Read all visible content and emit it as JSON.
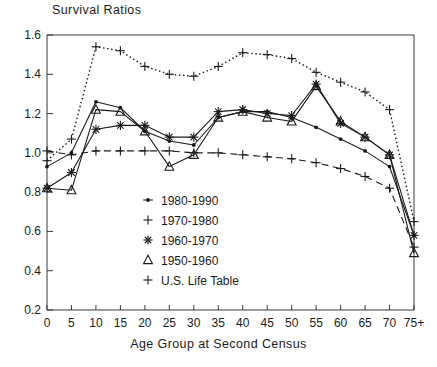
{
  "chart_data": {
    "type": "line",
    "title": "Survival Ratios",
    "xlabel": "Age Group at Second Census",
    "ylabel": "",
    "categories": [
      "0",
      "5",
      "10",
      "15",
      "20",
      "25",
      "30",
      "35",
      "40",
      "45",
      "50",
      "55",
      "60",
      "65",
      "70",
      "75+"
    ],
    "ylim": [
      0.2,
      1.6
    ],
    "yticks": [
      0.2,
      0.4,
      0.6,
      0.8,
      1.0,
      1.2,
      1.4,
      1.6
    ],
    "ytick_labels": [
      "0.2",
      "0.4",
      "0.6",
      "0.8",
      "1.0",
      "1.2",
      "1.4",
      "1.6"
    ],
    "grid": false,
    "legend_position": "inside-center-left",
    "series": [
      {
        "name": "1980-1990",
        "marker": "small-dot",
        "line_style": "solid",
        "values": [
          0.93,
          1.0,
          1.26,
          1.23,
          1.11,
          1.06,
          1.04,
          1.18,
          1.21,
          1.21,
          1.18,
          1.13,
          1.07,
          1.01,
          0.93,
          0.58
        ]
      },
      {
        "name": "1970-1980",
        "marker": "plus",
        "line_style": "dotted",
        "values": [
          0.96,
          1.07,
          1.54,
          1.52,
          1.44,
          1.4,
          1.39,
          1.44,
          1.51,
          1.5,
          1.48,
          1.41,
          1.36,
          1.31,
          1.22,
          0.65
        ]
      },
      {
        "name": "1960-1970",
        "marker": "asterisk",
        "line_style": "solid",
        "values": [
          0.82,
          0.9,
          1.12,
          1.14,
          1.14,
          1.08,
          1.08,
          1.21,
          1.22,
          1.2,
          1.19,
          1.35,
          1.15,
          1.08,
          0.99,
          0.58
        ]
      },
      {
        "name": "1950-1960",
        "marker": "triangle",
        "line_style": "solid",
        "values": [
          0.82,
          0.81,
          1.22,
          1.21,
          1.11,
          0.93,
          0.99,
          1.18,
          1.21,
          1.18,
          1.16,
          1.34,
          1.16,
          1.08,
          0.99,
          0.49
        ]
      },
      {
        "name": "U.S. Life Table",
        "marker": "plus",
        "line_style": "dashed",
        "values": [
          1.01,
          0.99,
          1.01,
          1.01,
          1.01,
          1.01,
          1.0,
          1.0,
          0.99,
          0.98,
          0.97,
          0.95,
          0.92,
          0.88,
          0.82,
          0.52
        ]
      }
    ]
  },
  "axes": {
    "title": "Survival Ratios",
    "xlabel": "Age Group at Second Census"
  },
  "legend": {
    "entries": [
      {
        "label": "1980-1990",
        "marker": "small-dot"
      },
      {
        "label": "1970-1980",
        "marker": "plus"
      },
      {
        "label": "1960-1970",
        "marker": "asterisk"
      },
      {
        "label": "1950-1960",
        "marker": "triangle"
      },
      {
        "label": "U.S. Life Table",
        "marker": "plus"
      }
    ]
  },
  "colors": {
    "line": "#1a1a1a",
    "axis": "#3a3a3a",
    "background": "#ffffff"
  }
}
